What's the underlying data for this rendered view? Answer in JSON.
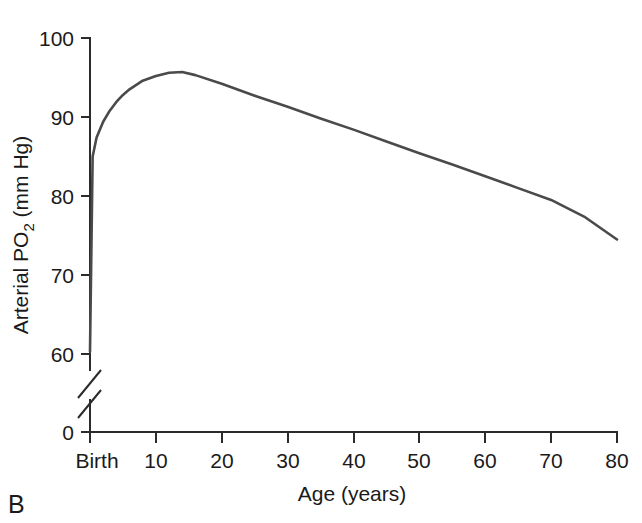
{
  "panel": {
    "label": "B"
  },
  "chart_data": {
    "type": "line",
    "title": "",
    "xlabel": "Age (years)",
    "ylabel_parts": {
      "pre": "Arterial PO",
      "sub": "2",
      "post": " (mm Hg)"
    },
    "ylabel": "Arterial PO2 (mm Hg)",
    "xtick_labels": [
      "Birth",
      "10",
      "20",
      "30",
      "40",
      "50",
      "60",
      "70",
      "80"
    ],
    "xtick_values": [
      0,
      10,
      20,
      30,
      40,
      50,
      60,
      70,
      80
    ],
    "ytick_labels": [
      "0",
      "60",
      "70",
      "80",
      "90",
      "100"
    ],
    "ytick_values": [
      0,
      60,
      70,
      80,
      90,
      100
    ],
    "xlim": [
      0,
      80
    ],
    "ylim": [
      60,
      100
    ],
    "y_axis_break": true,
    "y_axis_break_label": "axis-break-between-0-and-60",
    "grid": false,
    "legend": null,
    "series": [
      {
        "name": "Arterial PO2 vs Age",
        "x": [
          0,
          0.4,
          1,
          2,
          3,
          4,
          5,
          6,
          8,
          10,
          12,
          14,
          16,
          20,
          25,
          30,
          35,
          40,
          45,
          50,
          55,
          60,
          65,
          70,
          75,
          80
        ],
        "values": [
          60.3,
          85.0,
          87.4,
          89.4,
          90.8,
          91.9,
          92.8,
          93.5,
          94.6,
          95.2,
          95.6,
          95.7,
          95.3,
          94.2,
          92.7,
          91.3,
          89.8,
          88.4,
          86.9,
          85.4,
          84.0,
          82.5,
          81.0,
          79.5,
          77.4,
          74.5
        ]
      }
    ]
  },
  "icons": {
    "axis_break": "axis-break-icon"
  },
  "colors": {
    "curve": "#4a4a4a",
    "axis": "#2b2b2b",
    "text": "#1a1a1a",
    "background": "#ffffff"
  }
}
